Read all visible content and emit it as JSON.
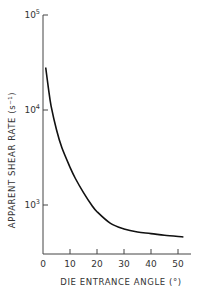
{
  "chart_data": {
    "type": "line",
    "title": "",
    "xlabel": "DIE ENTRANCE ANGLE (°)",
    "ylabel": "APPARENT SHEAR RATE (s⁻¹)",
    "yscale": "log",
    "xlim": [
      0,
      55
    ],
    "ylim": [
      300,
      100000
    ],
    "grid": false,
    "legend": null,
    "x_ticks": [
      0,
      10,
      20,
      30,
      40,
      50
    ],
    "y_ticks": [
      {
        "value": 1000,
        "label_base": "10",
        "label_exp": "3"
      },
      {
        "value": 10000,
        "label_base": "10",
        "label_exp": "4"
      },
      {
        "value": 100000,
        "label_base": "10",
        "label_exp": "5"
      }
    ],
    "series": [
      {
        "name": "apparent shear rate",
        "x": [
          1,
          2,
          3,
          5,
          7,
          10,
          12,
          15,
          18,
          20,
          25,
          30,
          35,
          40,
          45,
          52
        ],
        "y": [
          28000,
          17000,
          11000,
          6200,
          4000,
          2500,
          1900,
          1350,
          1000,
          850,
          640,
          560,
          520,
          500,
          480,
          460
        ]
      }
    ]
  }
}
